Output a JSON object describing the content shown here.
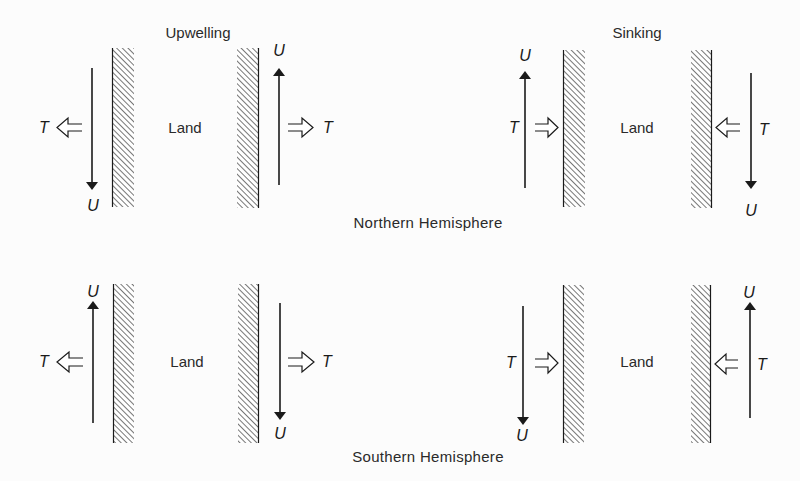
{
  "titles": {
    "upwelling": "Upwelling",
    "sinking": "Sinking"
  },
  "captions": {
    "northern": "Northern Hemisphere",
    "southern": "Southern Hemisphere"
  },
  "labels": {
    "land": "Land",
    "current": "U",
    "transport": "T"
  },
  "legend_meaning": {
    "U": "alongshore current / wind-driven flow (solid arrow)",
    "T": "Ekman transport (hollow arrow)",
    "wall": "coastline (hatched)"
  },
  "panels": [
    {
      "row": "northern",
      "column": "upwelling",
      "coast": "west-facing (ocean on left)",
      "U": "down",
      "T": "left (offshore)"
    },
    {
      "row": "northern",
      "column": "upwelling",
      "coast": "east-facing (ocean on right)",
      "U": "up",
      "T": "right (offshore)"
    },
    {
      "row": "northern",
      "column": "sinking",
      "coast": "west-facing (ocean on left)",
      "U": "up",
      "T": "right (onshore)"
    },
    {
      "row": "northern",
      "column": "sinking",
      "coast": "east-facing (ocean on right)",
      "U": "down",
      "T": "left (onshore)"
    },
    {
      "row": "southern",
      "column": "upwelling",
      "coast": "west-facing (ocean on left)",
      "U": "up",
      "T": "left (offshore)"
    },
    {
      "row": "southern",
      "column": "upwelling",
      "coast": "east-facing (ocean on right)",
      "U": "down",
      "T": "right (offshore)"
    },
    {
      "row": "southern",
      "column": "sinking",
      "coast": "west-facing (ocean on left)",
      "U": "down",
      "T": "right (onshore)"
    },
    {
      "row": "southern",
      "column": "sinking",
      "coast": "east-facing (ocean on right)",
      "U": "up",
      "T": "left (onshore)"
    }
  ],
  "colors": {
    "ink": "#1a1a1a",
    "hatch": "#555555",
    "background": "#fcfcfc"
  }
}
